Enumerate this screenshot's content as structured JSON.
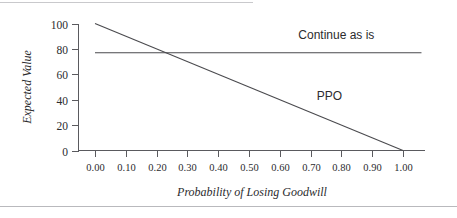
{
  "figure": {
    "name": "expected-value-vs-probability-of-losing-goodwill"
  },
  "chart_data": {
    "type": "line",
    "title": "",
    "xlabel": "Probability of Losing Goodwill",
    "ylabel": "Expected Value",
    "xlim": [
      0.0,
      1.05
    ],
    "ylim": [
      0,
      100
    ],
    "grid": false,
    "legend_position": "inline-labels",
    "xticks": [
      0.0,
      0.1,
      0.2,
      0.3,
      0.4,
      0.5,
      0.6,
      0.7,
      0.8,
      0.9,
      1.0
    ],
    "xtick_labels": [
      "0.00",
      "0.10",
      "0.20",
      "0.30",
      "0.40",
      "0.50",
      "0.60",
      "0.70",
      "0.80",
      "0.90",
      "1.00"
    ],
    "yticks": [
      0,
      20,
      40,
      60,
      80,
      100
    ],
    "ytick_labels": [
      "0",
      "20",
      "40",
      "60",
      "80",
      "100"
    ],
    "series": [
      {
        "name": "PPO",
        "label": "PPO",
        "color": "#4a4a4e",
        "x": [
          0.0,
          1.0
        ],
        "values": [
          100,
          0
        ],
        "label_x": 0.72,
        "label_y": 40
      },
      {
        "name": "Continue as is",
        "label": "Continue as is",
        "color": "#4a4a4e",
        "x": [
          0.0,
          1.06
        ],
        "values": [
          77,
          77
        ],
        "label_x": 0.66,
        "label_y": 88
      }
    ],
    "annotations": [
      {
        "name": "intersection",
        "x": 0.23,
        "y": 77
      }
    ]
  }
}
